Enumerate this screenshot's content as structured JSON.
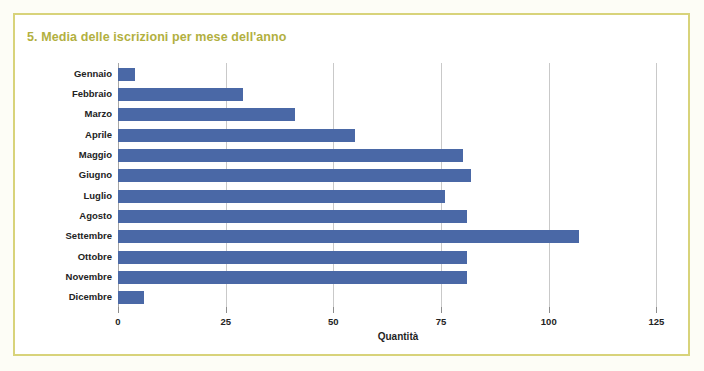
{
  "chart_data": {
    "type": "bar",
    "orientation": "horizontal",
    "title": "5. Media delle iscrizioni per mese dell'anno",
    "xlabel": "Quantità",
    "ylabel": "",
    "categories": [
      "Gennaio",
      "Febbraio",
      "Marzo",
      "Aprile",
      "Maggio",
      "Giugno",
      "Luglio",
      "Agosto",
      "Settembre",
      "Ottobre",
      "Novembre",
      "Dicembre"
    ],
    "values": [
      4,
      29,
      41,
      55,
      80,
      82,
      76,
      81,
      107,
      81,
      81,
      6
    ],
    "xlim": [
      0,
      130
    ],
    "xticks": [
      0,
      25,
      50,
      75,
      100,
      125
    ],
    "xtick_labels": [
      "0",
      "25",
      "50",
      "75",
      "100",
      "125"
    ],
    "grid": "vertical",
    "legend": "none",
    "series": [
      {
        "name": "Media iscrizioni",
        "values": [
          4,
          29,
          41,
          55,
          80,
          82,
          76,
          81,
          107,
          81,
          81,
          6
        ]
      }
    ],
    "colors": {
      "bar": "#4a68a6",
      "title": "#b2b03f",
      "gridline": "#c9c9c9",
      "frame": "#d8d37a",
      "plot_background": "#ffffff",
      "page_background": "#fdfdf6",
      "text": "#232323"
    }
  }
}
